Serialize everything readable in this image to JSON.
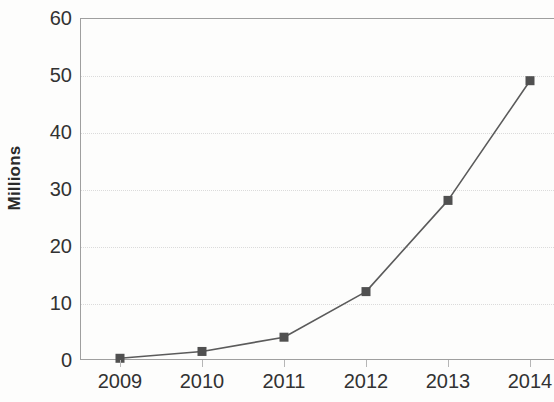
{
  "chart_data": {
    "type": "line",
    "title": "",
    "subtitle": "",
    "xlabel": "",
    "ylabel": "Millions",
    "categories": [
      "2009",
      "2010",
      "2011",
      "2012",
      "2013",
      "2014"
    ],
    "x": [
      2009,
      2010,
      2011,
      2012,
      2013,
      2014
    ],
    "values": [
      0.3,
      1.5,
      4,
      12,
      28,
      49
    ],
    "series": [
      {
        "name": "Millions",
        "values": [
          0.3,
          1.5,
          4,
          12,
          28,
          49
        ]
      }
    ],
    "ylim": [
      0,
      60
    ],
    "yticks": [
      0,
      10,
      20,
      30,
      40,
      50,
      60
    ],
    "ytick_labels": [
      "0",
      "10",
      "20",
      "30",
      "40",
      "50",
      "60"
    ],
    "xtick_labels": [
      "2009",
      "2010",
      "2011",
      "2012",
      "2013",
      "2014"
    ],
    "grid": true,
    "grid_axis": "y",
    "legend": false,
    "legend_position": "none",
    "marker": "square",
    "line_color": "#555555",
    "marker_color": "#4a4a4a",
    "grid_color": "#dadada",
    "axis_color": "#9c9c9c",
    "text_color": "#2b2b2b",
    "background_color": "#fdfdfc",
    "note": "Chart is cropped at the right edge of the image; plot frame continues past 2014."
  }
}
